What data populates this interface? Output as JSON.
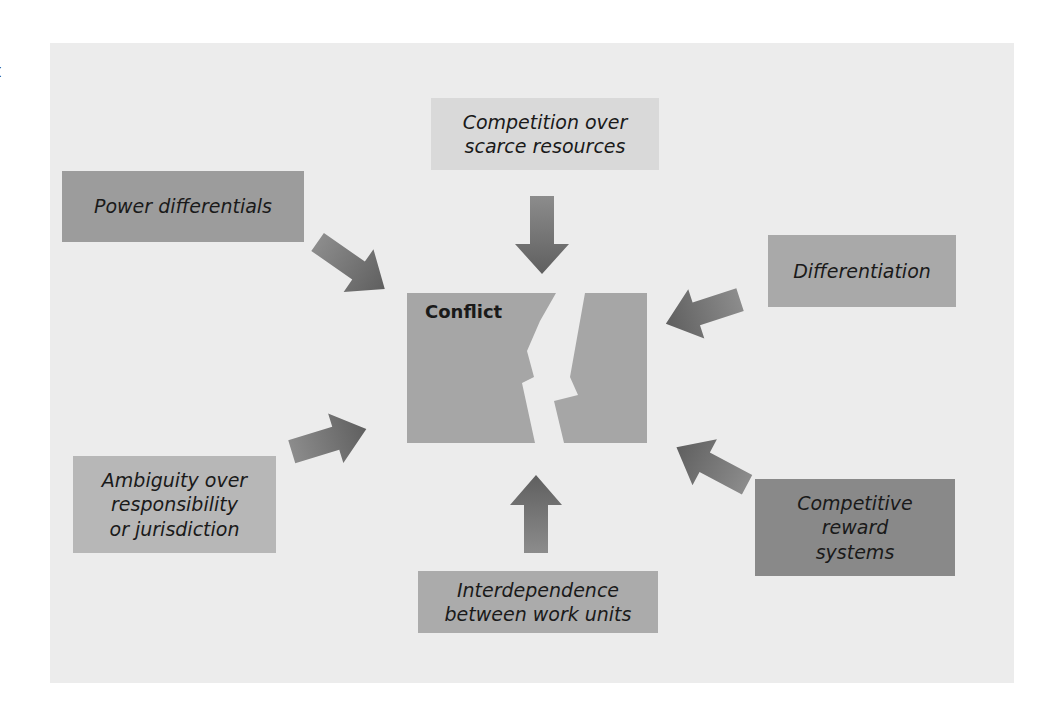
{
  "edge_fragment": "t",
  "diagram": {
    "center": {
      "label": "Conflict",
      "color": "#a6a6a6"
    },
    "causes": [
      {
        "id": "power",
        "label": "Power differentials",
        "color": "#9c9c9c"
      },
      {
        "id": "competition",
        "label": "Competition over\nscarce resources",
        "color": "#d9d9d9"
      },
      {
        "id": "differentiation",
        "label": "Differentiation",
        "color": "#a9a9a9"
      },
      {
        "id": "reward",
        "label": "Competitive\nreward\nsystems",
        "color": "#898989"
      },
      {
        "id": "interdependence",
        "label": "Interdependence\nbetween work units",
        "color": "#ababab"
      },
      {
        "id": "ambiguity",
        "label": "Ambiguity over\nresponsibility\nor jurisdiction",
        "color": "#b7b7b7"
      }
    ],
    "colors": {
      "panel_bg": "#ececec",
      "arrow": "#6e6e6e",
      "crack": "#ececec"
    }
  }
}
